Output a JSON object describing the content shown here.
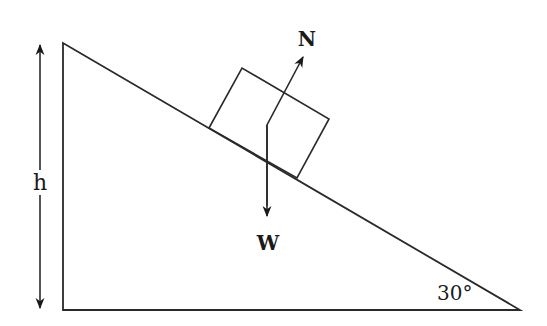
{
  "diagram": {
    "labels": {
      "height": "h",
      "normal_force": "N",
      "weight": "W",
      "angle": "30°"
    },
    "geometry": {
      "incline_angle_deg": 30,
      "triangle": {
        "top": [
          63,
          43
        ],
        "bottom_left": [
          63,
          310
        ],
        "bottom_right": [
          520,
          310
        ]
      },
      "block": [
        [
          209,
          128
        ],
        [
          242,
          68
        ],
        [
          329,
          119
        ],
        [
          297,
          178
        ]
      ],
      "force_origin": [
        267,
        125
      ],
      "normal_tip": [
        303,
        55
      ],
      "weight_tip": [
        267,
        217
      ],
      "height_arrow": {
        "x": 40,
        "top": 43,
        "bottom": 310
      }
    },
    "colors": {
      "stroke": "#2a2a2a",
      "background": "#ffffff"
    }
  }
}
